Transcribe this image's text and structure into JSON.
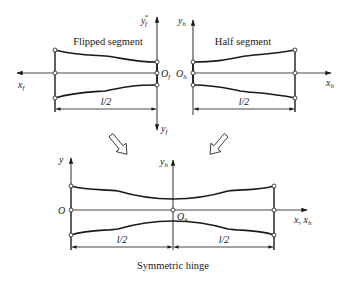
{
  "diagram": {
    "flipped": {
      "title": "Flipped segment",
      "x_axis": "x",
      "x_axis_sub": "f",
      "y_axis_top": "y",
      "y_axis_top_sub": "f",
      "y_axis_top_sup": "*",
      "y_axis_bottom": "y",
      "y_axis_bottom_sub": "f",
      "origin": "O",
      "origin_sub": "f",
      "dimension": "l/2"
    },
    "half": {
      "title": "Half segment",
      "x_axis": "x",
      "x_axis_sub": "h",
      "y_axis": "y",
      "y_axis_sub": "h",
      "origin": "O",
      "origin_sub": "h",
      "dimension": "l/2"
    },
    "symmetric": {
      "title": "Symmetric hinge",
      "y_axis_left": "y",
      "y_axis_center": "y",
      "y_axis_center_sub": "h",
      "origin_left": "O",
      "origin_center": "O",
      "origin_center_sub": "h",
      "x_axis": "x, x",
      "x_axis_sub": "h",
      "dimension_left": "l/2",
      "dimension_right": "l/2"
    },
    "colors": {
      "stroke": "#1a1a1a",
      "thin": "#333333",
      "background": "#ffffff"
    }
  }
}
